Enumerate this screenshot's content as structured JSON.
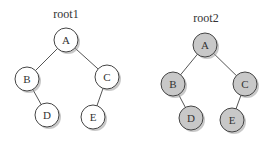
{
  "colors": {
    "tree1_fill": "#ffffff",
    "tree2_fill": "#c8c8c8",
    "stroke": "#444444",
    "edge": "#555555",
    "text": "#333333"
  },
  "trees": [
    {
      "label": "root1",
      "label_pos": [
        66,
        18
      ],
      "fill": "#ffffff",
      "nodes": [
        {
          "id": "A",
          "x": 66,
          "y": 40
        },
        {
          "id": "B",
          "x": 27,
          "y": 79
        },
        {
          "id": "C",
          "x": 107,
          "y": 77
        },
        {
          "id": "D",
          "x": 47,
          "y": 115
        },
        {
          "id": "E",
          "x": 93,
          "y": 117
        }
      ],
      "edges": [
        [
          "A",
          "B"
        ],
        [
          "A",
          "C"
        ],
        [
          "B",
          "D"
        ],
        [
          "C",
          "E"
        ]
      ]
    },
    {
      "label": "root2",
      "label_pos": [
        206,
        22
      ],
      "fill": "#c8c8c8",
      "nodes": [
        {
          "id": "A",
          "x": 205,
          "y": 45
        },
        {
          "id": "B",
          "x": 173,
          "y": 84
        },
        {
          "id": "C",
          "x": 245,
          "y": 84
        },
        {
          "id": "D",
          "x": 191,
          "y": 118
        },
        {
          "id": "E",
          "x": 232,
          "y": 120
        }
      ],
      "edges": [
        [
          "A",
          "B"
        ],
        [
          "A",
          "C"
        ],
        [
          "B",
          "D"
        ],
        [
          "C",
          "E"
        ]
      ]
    }
  ],
  "node_radius": 12
}
